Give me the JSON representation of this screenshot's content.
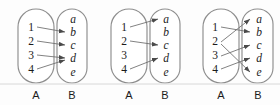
{
  "figure": {
    "background_color": "#fdfdfd",
    "oval_stroke_color": "#8e8e8e",
    "arrow_color": "#6b6b6b",
    "text_color": "#1b1b1b",
    "diagram_count": 3
  },
  "diagrams": [
    {
      "id": "diagram-1",
      "domain_label": "A",
      "codomain_label": "B",
      "domain_elements": [
        "1",
        "2",
        "3",
        "4"
      ],
      "codomain_elements": [
        "a",
        "b",
        "c",
        "d",
        "e"
      ],
      "arrows": [
        {
          "from": "1",
          "to": "b"
        },
        {
          "from": "2",
          "to": "c"
        },
        {
          "from": "3",
          "to": "d"
        },
        {
          "from": "4",
          "to": "d"
        }
      ]
    },
    {
      "id": "diagram-2",
      "domain_label": "A",
      "codomain_label": "B",
      "domain_elements": [
        "1",
        "2",
        "3",
        "4"
      ],
      "codomain_elements": [
        "a",
        "b",
        "c",
        "d",
        "e"
      ],
      "arrows": [
        {
          "from": "1",
          "to": "a"
        },
        {
          "from": "2",
          "to": "c"
        },
        {
          "from": "4",
          "to": "d"
        }
      ]
    },
    {
      "id": "diagram-3",
      "domain_label": "A",
      "codomain_label": "B",
      "domain_elements": [
        "1",
        "2",
        "3",
        "4"
      ],
      "codomain_elements": [
        "a",
        "b",
        "c",
        "d",
        "e"
      ],
      "arrows": [
        {
          "from": "1",
          "to": "b"
        },
        {
          "from": "2",
          "to": "a"
        },
        {
          "from": "2",
          "to": "e"
        },
        {
          "from": "3",
          "to": "c"
        },
        {
          "from": "4",
          "to": "d"
        }
      ]
    }
  ]
}
